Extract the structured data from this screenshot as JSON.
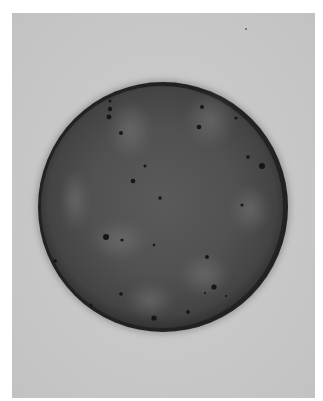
{
  "image": {
    "subject": "petri dish with bacterial colonies",
    "colors": {
      "background": "#ffffff",
      "board": "#c8c8c8",
      "agar_dark": "#3a3a3a",
      "agar_light": "#6e6e6e",
      "rim": "#1e1e1e",
      "colony": "#151515"
    },
    "colony_count": 26
  }
}
